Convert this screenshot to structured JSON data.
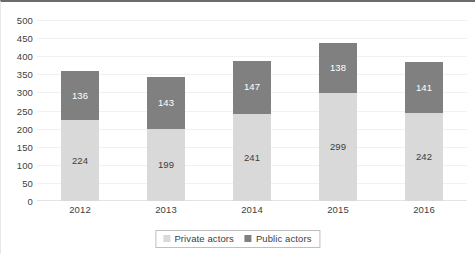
{
  "chart_data": {
    "type": "bar",
    "subtype": "stacked-bar",
    "title": "",
    "subtitle": "",
    "xlabel": "",
    "ylabel": "",
    "categories": [
      "2012",
      "2013",
      "2014",
      "2015",
      "2016"
    ],
    "series": [
      {
        "name": "Private actors",
        "color": "#d9d9d9",
        "values": [
          224,
          199,
          241,
          299,
          242
        ]
      },
      {
        "name": "Public actors",
        "color": "#808080",
        "values": [
          136,
          143,
          147,
          138,
          141
        ]
      }
    ],
    "totals": [
      360,
      342,
      388,
      437,
      383
    ],
    "ylim": [
      0,
      500
    ],
    "ytick_step": 50,
    "yticks": [
      "500",
      "450",
      "400",
      "350",
      "300",
      "250",
      "200",
      "150",
      "100",
      "50",
      "0"
    ],
    "grid": true,
    "grid_axis": "y",
    "legend_position": "bottom-center",
    "data_labels": true,
    "stack_order": [
      "Private actors",
      "Public actors"
    ]
  },
  "legend": {
    "items": [
      {
        "label": "Private actors",
        "color": "#d9d9d9"
      },
      {
        "label": "Public actors",
        "color": "#808080"
      }
    ]
  },
  "colors": {
    "private": "#d9d9d9",
    "public": "#808080",
    "grid": "#f1f1f1",
    "axis_text": "#404040",
    "top_border": "#6b6b6b"
  }
}
